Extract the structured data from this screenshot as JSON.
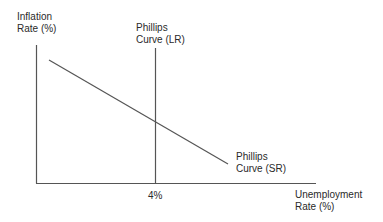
{
  "labels": {
    "y_axis_line1": "Inflation",
    "y_axis_line2": "Rate (%)",
    "x_axis_line1": "Unemployment",
    "x_axis_line2": "Rate (%)",
    "lr_curve_line1": "Phillips",
    "lr_curve_line2": "Curve (LR)",
    "sr_curve_line1": "Phillips",
    "sr_curve_line2": "Curve (SR)",
    "natural_rate_tick": "4%"
  },
  "colors": {
    "line": "#555555",
    "text": "#2a2a2a",
    "background": "#ffffff"
  }
}
